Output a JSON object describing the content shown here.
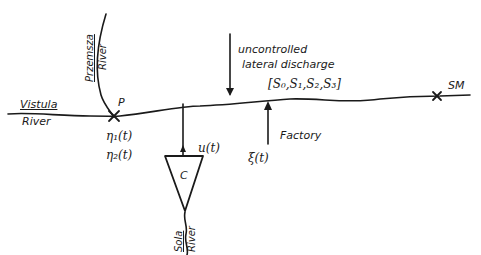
{
  "diagram": {
    "type": "river system schematic",
    "colors": {
      "ink": "#1a1a1a",
      "background": "#ffffff"
    },
    "rivers": {
      "main": {
        "name_line1": "Vistula",
        "name_line2": "River"
      },
      "tributary_top": {
        "name_line1": "Przemsza",
        "name_line2": "River"
      },
      "tributary_bottom": {
        "name_line1": "Sola",
        "name_line2": "River"
      }
    },
    "points": {
      "P": "P",
      "SM": "SM"
    },
    "inputs": {
      "eta1": "η₁(t)",
      "eta2": "η₂(t)",
      "u": "u(t)",
      "xi": "ξ(t)"
    },
    "reservoir": {
      "label": "C"
    },
    "discharge": {
      "line1": "uncontrolled",
      "line2": "lateral discharge"
    },
    "factory": {
      "label": "Factory"
    },
    "parameters": "[S₀,S₁,S₂,S₃]"
  }
}
